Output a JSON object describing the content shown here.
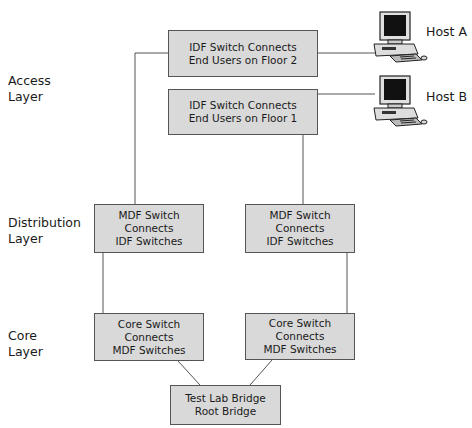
{
  "layers": {
    "access": [
      "Access",
      "Layer"
    ],
    "distribution": [
      "Distribution",
      "Layer"
    ],
    "core": [
      "Core",
      "Layer"
    ]
  },
  "boxes": {
    "idf2": [
      "IDF Switch Connects",
      "End Users on Floor 2"
    ],
    "idf1": [
      "IDF Switch Connects",
      "End Users on Floor 1"
    ],
    "mdf_left": [
      "MDF Switch Connects",
      "IDF Switches"
    ],
    "mdf_right": [
      "MDF Switch Connects",
      "IDF Switches"
    ],
    "core_left": [
      "Core Switch Connects",
      "MDF Switches"
    ],
    "core_right": [
      "Core Switch Connects",
      "MDF Switches"
    ],
    "root": [
      "Test Lab Bridge",
      "Root Bridge"
    ]
  },
  "hosts": {
    "a": "Host A",
    "b": "Host B"
  },
  "colors": {
    "box_fill": "#d9d9d9",
    "line": "#555555"
  }
}
